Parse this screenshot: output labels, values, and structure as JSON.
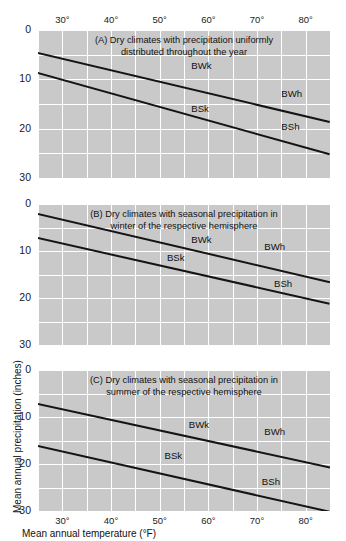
{
  "figure": {
    "xaxis_title": "Mean annual temperature (°F)",
    "yaxis_title": "Mean annual precipitation (inches)"
  },
  "chart_data": {
    "type": "line",
    "title": "",
    "xlabel": "Mean annual temperature (°F)",
    "ylabel": "Mean annual precipitation (inches)",
    "xlim": [
      25,
      85
    ],
    "ylim": [
      0,
      30
    ],
    "y_inverted": true,
    "grid": true,
    "xticks": [
      30,
      40,
      50,
      60,
      70,
      80
    ],
    "xtick_labels": [
      "30°",
      "40°",
      "50°",
      "60°",
      "70°",
      "80°"
    ],
    "xgrid_step": 5,
    "yticks": [
      0,
      10,
      20,
      30
    ],
    "ytick_labels": [
      "0",
      "10",
      "20",
      "30"
    ],
    "ygrid_step": 5,
    "legend": "none",
    "panels": [
      {
        "id": "A",
        "title": "(A) Dry climates with precipitation uniformly distributed throughout the year",
        "title_lines": [
          "(A) Dry climates with precipitation uniformly",
          "distributed throughout the year"
        ],
        "xtick_position": "top",
        "series": [
          {
            "name": "BW/BS boundary",
            "x": [
              25,
              85
            ],
            "values": [
              4.5,
              18.5
            ]
          },
          {
            "name": "BS/humid boundary",
            "x": [
              25,
              85
            ],
            "values": [
              8.5,
              25.0
            ]
          }
        ],
        "annotations": [
          {
            "text": "BWk",
            "x": 56.5,
            "y": 7.2
          },
          {
            "text": "BWh",
            "x": 75.0,
            "y": 13.0
          },
          {
            "text": "BSk",
            "x": 56.5,
            "y": 16.0
          },
          {
            "text": "BSh",
            "x": 75.0,
            "y": 19.6
          }
        ]
      },
      {
        "id": "B",
        "title": "(B) Dry climates with seasonal precipitation in winter of the respective hemisphere",
        "title_lines": [
          "(B) Dry climates with seasonal precipitation in",
          "winter of the respective hemisphere"
        ],
        "xtick_position": "none",
        "series": [
          {
            "name": "BW/BS boundary",
            "x": [
              25,
              85
            ],
            "values": [
              2.0,
              16.5
            ]
          },
          {
            "name": "BS/humid boundary",
            "x": [
              25,
              85
            ],
            "values": [
              7.0,
              21.0
            ]
          }
        ],
        "annotations": [
          {
            "text": "BWk",
            "x": 56.5,
            "y": 7.6
          },
          {
            "text": "BWh",
            "x": 71.5,
            "y": 9.2
          },
          {
            "text": "BSk",
            "x": 51.5,
            "y": 11.4
          },
          {
            "text": "BSh",
            "x": 73.5,
            "y": 17.0
          }
        ]
      },
      {
        "id": "C",
        "title": "(C) Dry climates with seasonal precipitation in summer of the respective hemisphere",
        "title_lines": [
          "(C) Dry climates with seasonal precipitation in",
          "summer of the respective hemisphere"
        ],
        "xtick_position": "bottom",
        "series": [
          {
            "name": "BW/BS boundary",
            "x": [
              25,
              85
            ],
            "values": [
              7.0,
              20.5
            ]
          },
          {
            "name": "BS/humid boundary",
            "x": [
              25,
              85
            ],
            "values": [
              16.0,
              30.0
            ]
          }
        ],
        "annotations": [
          {
            "text": "BWk",
            "x": 56.0,
            "y": 11.8
          },
          {
            "text": "BWh",
            "x": 71.5,
            "y": 13.2
          },
          {
            "text": "BSk",
            "x": 51.0,
            "y": 18.2
          },
          {
            "text": "BSh",
            "x": 71.0,
            "y": 23.8
          }
        ]
      }
    ]
  }
}
